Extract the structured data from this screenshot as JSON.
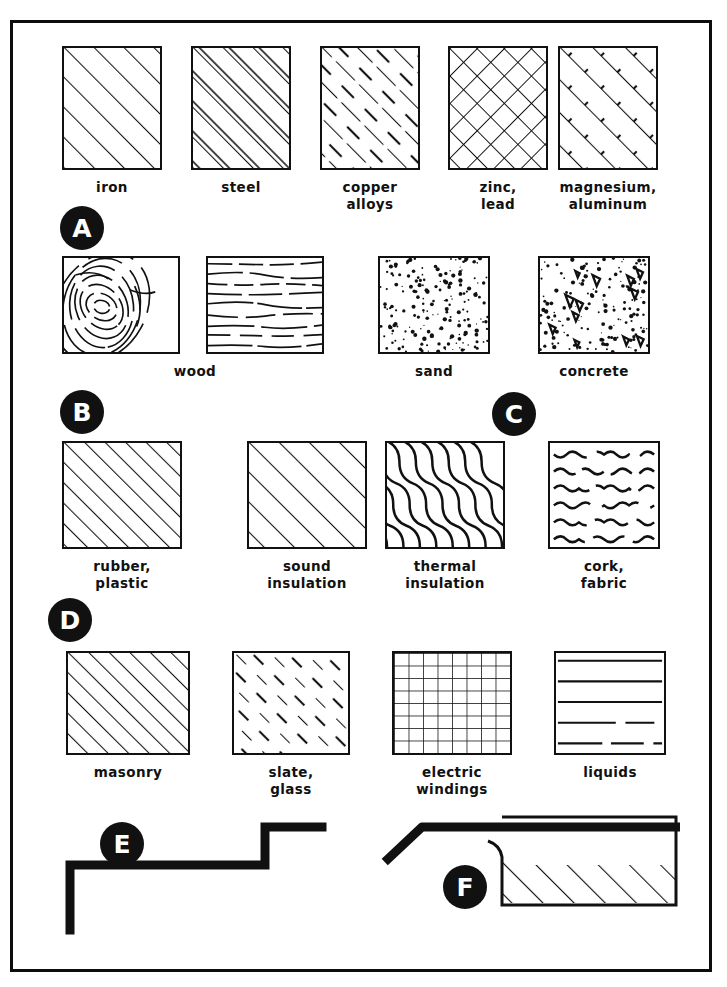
{
  "sheet": {
    "title": "Material hatching symbols",
    "border_color": "#0d0d0d",
    "ink_color": "#111111",
    "background": "#ffffff"
  },
  "groups": [
    {
      "id": "A",
      "label": "A",
      "x": 60,
      "y": 206
    },
    {
      "id": "B",
      "label": "B",
      "x": 60,
      "y": 390
    },
    {
      "id": "C",
      "label": "C",
      "x": 492,
      "y": 392
    },
    {
      "id": "D",
      "label": "D",
      "x": 48,
      "y": 598
    },
    {
      "id": "E",
      "label": "E",
      "x": 100,
      "y": 822
    },
    {
      "id": "F",
      "label": "F",
      "x": 443,
      "y": 865
    }
  ],
  "rows": [
    {
      "id": "row-a",
      "panels": [
        {
          "name": "iron",
          "caption": "iron",
          "pattern": "diagonal-medium",
          "x": 62,
          "y": 46,
          "w": 100,
          "h": 124
        },
        {
          "name": "steel",
          "caption": "steel",
          "pattern": "diagonal-double",
          "x": 191,
          "y": 46,
          "w": 100,
          "h": 124
        },
        {
          "name": "copper-alloys",
          "caption": "copper\nalloys",
          "pattern": "diagonal-broken",
          "x": 320,
          "y": 46,
          "w": 100,
          "h": 124
        },
        {
          "name": "zinc-lead",
          "caption": "zinc,\nlead",
          "pattern": "crosshatch-diamond",
          "x": 448,
          "y": 46,
          "w": 100,
          "h": 124
        },
        {
          "name": "magnesium-aluminum",
          "caption": "magnesium,\naluminum",
          "pattern": "diagonal-ticked",
          "x": 558,
          "y": 46,
          "w": 100,
          "h": 124
        }
      ]
    },
    {
      "id": "row-b",
      "panels": [
        {
          "name": "wood-end-grain",
          "caption": "",
          "pattern": "wood-rings",
          "x": 62,
          "y": 256,
          "w": 118,
          "h": 98
        },
        {
          "name": "wood-long-grain",
          "caption": "wood",
          "pattern": "wood-grain",
          "x": 206,
          "y": 256,
          "w": 118,
          "h": 98
        },
        {
          "name": "sand",
          "caption": "sand",
          "pattern": "stipple",
          "x": 378,
          "y": 256,
          "w": 112,
          "h": 98
        },
        {
          "name": "concrete",
          "caption": "concrete",
          "pattern": "concrete",
          "x": 538,
          "y": 256,
          "w": 112,
          "h": 98
        }
      ]
    },
    {
      "id": "row-d",
      "panels": [
        {
          "name": "rubber-plastic",
          "caption": "rubber,\nplastic",
          "pattern": "diagonal-dense",
          "x": 62,
          "y": 441,
          "w": 120,
          "h": 108
        },
        {
          "name": "sound-insulation",
          "caption": "sound\ninsulation",
          "pattern": "diagonal-medium",
          "x": 247,
          "y": 441,
          "w": 120,
          "h": 108
        },
        {
          "name": "thermal-insulation",
          "caption": "thermal\ninsulation",
          "pattern": "wavy-diagonal",
          "x": 385,
          "y": 441,
          "w": 120,
          "h": 108
        },
        {
          "name": "cork-fabric",
          "caption": "cork,\nfabric",
          "pattern": "wavy-horizontal",
          "x": 548,
          "y": 441,
          "w": 112,
          "h": 108
        }
      ]
    },
    {
      "id": "row-e",
      "panels": [
        {
          "name": "masonry",
          "caption": "masonry",
          "pattern": "diagonal-dense",
          "x": 66,
          "y": 651,
          "w": 124,
          "h": 104
        },
        {
          "name": "slate-glass",
          "caption": "slate,\nglass",
          "pattern": "diagonal-dashed",
          "x": 232,
          "y": 651,
          "w": 118,
          "h": 104
        },
        {
          "name": "electric-windings",
          "caption": "electric\nwindings",
          "pattern": "grid",
          "x": 392,
          "y": 651,
          "w": 120,
          "h": 104
        },
        {
          "name": "liquids",
          "caption": "liquids",
          "pattern": "horizontal-lines",
          "x": 554,
          "y": 651,
          "w": 112,
          "h": 104
        }
      ]
    }
  ],
  "figures": {
    "e": {
      "name": "stepped-profile-line",
      "x": 60,
      "y": 805,
      "w": 270,
      "h": 130
    },
    "f": {
      "name": "broken-out-section",
      "x": 380,
      "y": 805,
      "w": 300,
      "h": 120
    }
  }
}
